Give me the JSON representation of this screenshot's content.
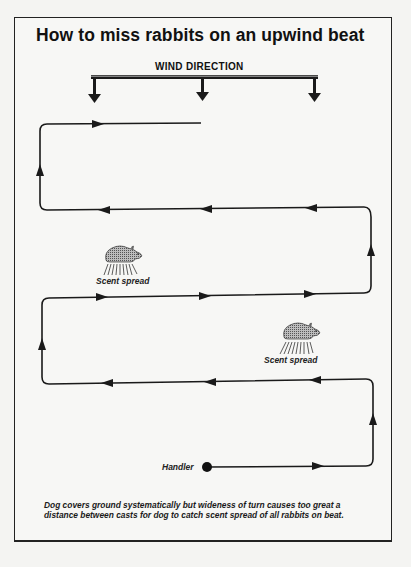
{
  "title": "How to miss rabbits on an upwind beat",
  "wind": {
    "label": "WIND DIRECTION",
    "arrow_count": 3
  },
  "rabbits": [
    {
      "label": "Scent spread",
      "position": "upper-left"
    },
    {
      "label": "Scent spread",
      "position": "lower-right"
    }
  ],
  "handler": {
    "label": "Handler"
  },
  "caption": "Dog covers ground systematically but wideness of turn causes too great a distance between casts for dog to catch scent spread of all rabbits on beat.",
  "colors": {
    "ink": "#1a1a1a",
    "paper": "#f7f7f5",
    "rabbit_fill": "#8a8a8a"
  }
}
